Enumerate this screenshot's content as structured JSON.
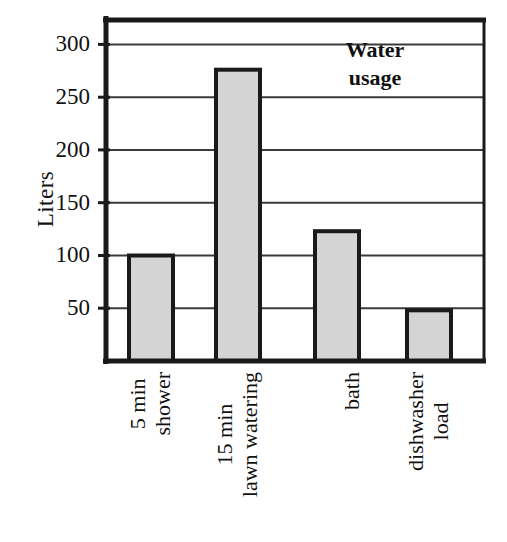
{
  "chart_data": {
    "type": "bar",
    "title": "Water usage",
    "title_lines": [
      "Water",
      "usage"
    ],
    "xlabel": "",
    "ylabel": "Liters",
    "categories": [
      "5 min shower",
      "15 min lawn watering",
      "bath",
      "dishwasher load"
    ],
    "category_lines": [
      [
        "5 min",
        "shower"
      ],
      [
        "15 min",
        "lawn watering"
      ],
      [
        "bath"
      ],
      [
        "dishwasher",
        "load"
      ]
    ],
    "values": [
      100,
      276,
      123,
      48
    ],
    "unit": "Liters",
    "ylim": [
      0,
      325
    ],
    "yticks": [
      50,
      100,
      150,
      200,
      250,
      300
    ],
    "ytick_labels": [
      "50",
      "100",
      "150",
      "200",
      "250",
      "300"
    ],
    "grid": "horizontal",
    "legend": "none",
    "bar_fill_color": "#d4d4d4",
    "bar_stroke_color": "#1a1a1a",
    "axis_color": "#1a1a1a",
    "grid_color": "#3a3a3a",
    "background_color": "#ffffff"
  }
}
